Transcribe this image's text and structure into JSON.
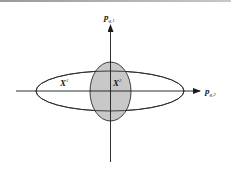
{
  "diagram": {
    "axes": {
      "vertical": {
        "label": "p",
        "subscript": "g,1"
      },
      "horizontal": {
        "label": "p",
        "subscript": "g,2"
      }
    },
    "regions": [
      {
        "label": "X",
        "superscript": "1",
        "shape": "wide-ellipse",
        "fill": "none"
      },
      {
        "label": "X",
        "superscript": "2",
        "shape": "tall-ellipse",
        "fill": "#c8c8c8"
      }
    ],
    "colors": {
      "stroke": "#2a2a2a",
      "shaded": "#c8c8c8",
      "background": "#ffffff"
    }
  }
}
